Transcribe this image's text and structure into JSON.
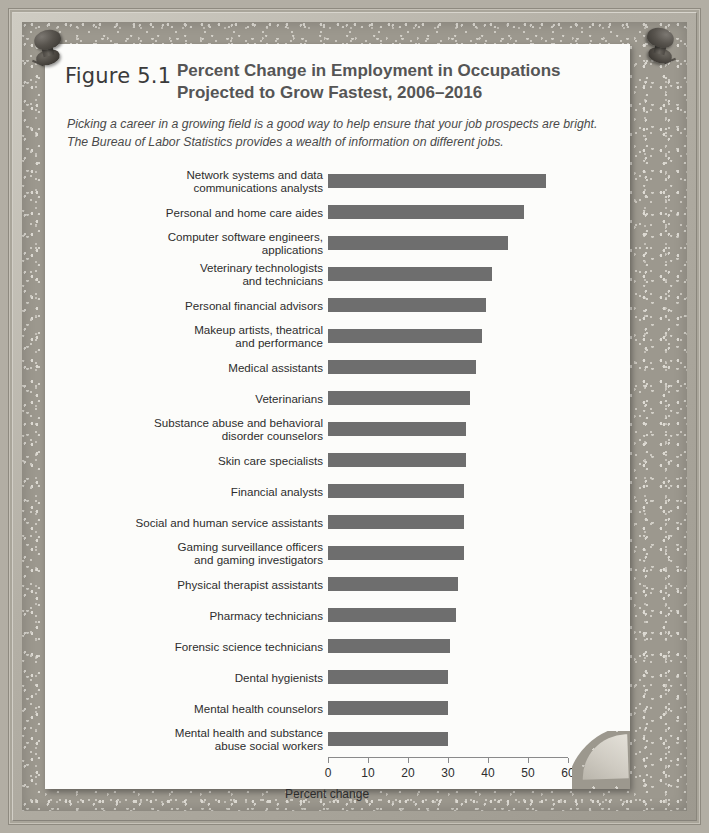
{
  "figure": {
    "number": "Figure 5.1",
    "title": "Percent Change in Employment in Occupations Projected to Grow Fastest, 2006–2016",
    "caption": "Picking a career in a growing field is a good way to help ensure that your job prospects are bright. The Bureau of Labor Statistics provides a wealth of information on different jobs."
  },
  "decor": {
    "pin_left": "pushpin-icon",
    "pin_right": "pushpin-icon",
    "corner": "page-curl-icon"
  },
  "colors": {
    "bar": "#6e6e6e",
    "paper": "#fcfcfa",
    "cork": "#9c988e",
    "title_text": "#555555",
    "axis": "#8a8a8a"
  },
  "chart_data": {
    "type": "bar",
    "orientation": "horizontal",
    "title": "Percent Change in Employment in Occupations Projected to Grow Fastest, 2006–2016",
    "xlabel": "Percent change",
    "ylabel": "",
    "xlim": [
      0,
      60
    ],
    "xticks": [
      0,
      10,
      20,
      30,
      40,
      50,
      60
    ],
    "xticklabels": [
      "0",
      "10",
      "20",
      "30",
      "40",
      "50",
      "60"
    ],
    "grid": false,
    "legend": null,
    "categories": [
      "Network systems and data communications analysts",
      "Personal and home care aides",
      "Computer software engineers, applications",
      "Veterinary technologists and technicians",
      "Personal financial advisors",
      "Makeup artists, theatrical and performance",
      "Medical assistants",
      "Veterinarians",
      "Substance abuse and behavioral disorder counselors",
      "Skin care specialists",
      "Financial analysts",
      "Social and human service assistants",
      "Gaming surveillance officers and gaming investigators",
      "Physical therapist assistants",
      "Pharmacy technicians",
      "Forensic science technicians",
      "Dental hygienists",
      "Mental health counselors",
      "Mental health and substance abuse social workers"
    ],
    "category_lines": [
      [
        "Network systems and data",
        "communications analysts"
      ],
      [
        "Personal and home care aides"
      ],
      [
        "Computer software engineers,",
        "applications"
      ],
      [
        "Veterinary technologists",
        "and technicians"
      ],
      [
        "Personal financial advisors"
      ],
      [
        "Makeup artists, theatrical",
        "and performance"
      ],
      [
        "Medical assistants"
      ],
      [
        "Veterinarians"
      ],
      [
        "Substance abuse and behavioral",
        "disorder counselors"
      ],
      [
        "Skin care specialists"
      ],
      [
        "Financial analysts"
      ],
      [
        "Social and human service assistants"
      ],
      [
        "Gaming surveillance officers",
        "and gaming investigators"
      ],
      [
        "Physical therapist assistants"
      ],
      [
        "Pharmacy technicians"
      ],
      [
        "Forensic science technicians"
      ],
      [
        "Dental hygienists"
      ],
      [
        "Mental health counselors"
      ],
      [
        "Mental health and substance",
        "abuse social workers"
      ]
    ],
    "values": [
      54.5,
      49,
      45,
      41,
      39.5,
      38.5,
      37,
      35.5,
      34.5,
      34.5,
      34,
      34,
      34,
      32.5,
      32,
      30.5,
      30,
      30,
      30
    ]
  }
}
